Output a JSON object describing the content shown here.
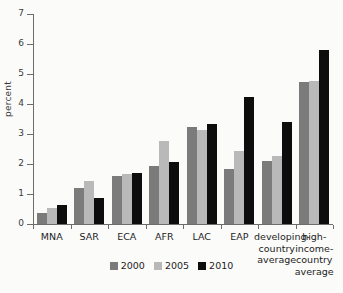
{
  "chart_data": {
    "type": "bar",
    "title": "",
    "xlabel": "",
    "ylabel": "percent",
    "ylim": [
      0,
      7
    ],
    "yticks": [
      0,
      1,
      2,
      3,
      4,
      5,
      6,
      7
    ],
    "ytick_labels": [
      "0",
      "1",
      "2",
      "3",
      "4",
      "5",
      "6",
      "7"
    ],
    "grid": false,
    "legend_position": "bottom-center",
    "categories": [
      "MNA",
      "SAR",
      "ECA",
      "AFR",
      "LAC",
      "EAP",
      "developing-\ncountry\naverage",
      "high-\nincome-\ncountry\naverage"
    ],
    "series": [
      {
        "name": "2000",
        "color": "#7b7b7b",
        "values": [
          0.37,
          1.19,
          1.61,
          1.95,
          3.25,
          1.82,
          2.1,
          4.73
        ]
      },
      {
        "name": "2005",
        "color": "#b9b9b9",
        "values": [
          0.55,
          1.44,
          1.66,
          2.78,
          3.12,
          2.42,
          2.28,
          4.78
        ]
      },
      {
        "name": "2010",
        "color": "#0d0d0d",
        "values": [
          0.63,
          0.87,
          1.71,
          2.08,
          3.35,
          4.25,
          3.41,
          5.79
        ]
      }
    ]
  },
  "legend": {
    "items": [
      {
        "label": "2000",
        "color": "#7b7b7b"
      },
      {
        "label": "2005",
        "color": "#b9b9b9"
      },
      {
        "label": "2010",
        "color": "#0d0d0d"
      }
    ]
  }
}
